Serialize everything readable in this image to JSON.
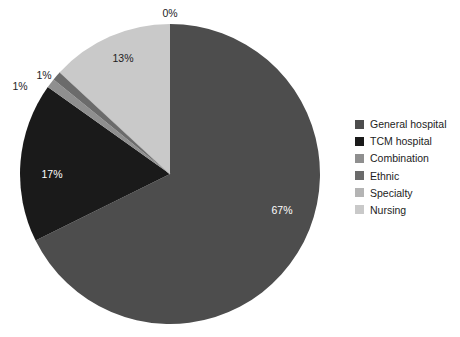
{
  "chart_data": {
    "type": "pie",
    "title": "",
    "categories": [
      "General hospital",
      "TCM hospital",
      "Combination",
      "Ethnic",
      "Specialty",
      "Nursing"
    ],
    "values": [
      67,
      17,
      1,
      1,
      0,
      13
    ],
    "data_labels": [
      "67%",
      "17%",
      "1%",
      "1%",
      "0%",
      "13%"
    ],
    "colors": [
      "#4d4d4d",
      "#1a1a1a",
      "#8f8f8f",
      "#6b6b6b",
      "#b4b4b4",
      "#c9c9c9"
    ],
    "legend_position": "right",
    "start_angle_deg": 0,
    "direction": "clockwise",
    "grid": false,
    "xlabel": "",
    "ylabel": ""
  },
  "pie": {
    "center_x": 170,
    "center_y": 174,
    "radius": 150,
    "slices": [
      {
        "name": "General hospital",
        "label": "67%",
        "value": 67,
        "color": "#4d4d4d",
        "label_x": 282,
        "label_y": 211,
        "label_style": "inside-light-text"
      },
      {
        "name": "TCM hospital",
        "label": "17%",
        "value": 17,
        "color": "#1a1a1a",
        "label_x": 52,
        "label_y": 175,
        "label_style": "inside-light-text"
      },
      {
        "name": "Combination",
        "label": "1%",
        "value": 1,
        "color": "#8f8f8f",
        "label_x": 20,
        "label_y": 87,
        "label_style": "outside-dark-text"
      },
      {
        "name": "Ethnic",
        "label": "1%",
        "value": 1,
        "color": "#6b6b6b",
        "label_x": 44,
        "label_y": 76,
        "label_style": "outside-dark-text"
      },
      {
        "name": "Specialty",
        "label": "0%",
        "value": 0,
        "color": "#b4b4b4",
        "label_x": 170,
        "label_y": 14,
        "label_style": "outside-dark-text"
      },
      {
        "name": "Nursing",
        "label": "13%",
        "value": 13,
        "color": "#c9c9c9",
        "label_x": 123,
        "label_y": 59,
        "label_style": "inside-dark-text"
      }
    ]
  },
  "legend": {
    "items": [
      {
        "label": "General hospital",
        "color": "#4d4d4d"
      },
      {
        "label": "TCM hospital",
        "color": "#1a1a1a"
      },
      {
        "label": "Combination",
        "color": "#8f8f8f"
      },
      {
        "label": "Ethnic",
        "color": "#6b6b6b"
      },
      {
        "label": "Specialty",
        "color": "#b4b4b4"
      },
      {
        "label": "Nursing",
        "color": "#c9c9c9"
      }
    ]
  },
  "background_color": "#ffffff"
}
